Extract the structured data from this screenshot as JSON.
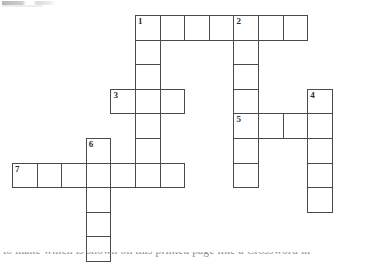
{
  "page": {
    "background_color": "#ffffff",
    "grid_line_color": "#4a4a4f",
    "number_color": "#2b2b2f",
    "width": 386,
    "height": 262
  },
  "grid": {
    "origin_x": 12,
    "origin_y": 15,
    "cell_size": 24.6,
    "columns": 13,
    "rows": 10
  },
  "entries": [
    {
      "number": "1",
      "direction": "across",
      "row": 0,
      "col": 5,
      "length": 7
    },
    {
      "number": "1",
      "direction": "down",
      "row": 0,
      "col": 5,
      "length": 7
    },
    {
      "number": "2",
      "direction": "down",
      "row": 0,
      "col": 9,
      "length": 7
    },
    {
      "number": "3",
      "direction": "across",
      "row": 3,
      "col": 4,
      "length": 3
    },
    {
      "number": "4",
      "direction": "down",
      "row": 3,
      "col": 12,
      "length": 5
    },
    {
      "number": "5",
      "direction": "across",
      "row": 4,
      "col": 9,
      "length": 4
    },
    {
      "number": "6",
      "direction": "down",
      "row": 5,
      "col": 3,
      "length": 5
    },
    {
      "number": "7",
      "direction": "across",
      "row": 6,
      "col": 0,
      "length": 7
    }
  ],
  "cells": [
    {
      "row": 0,
      "col": 5,
      "number": "1"
    },
    {
      "row": 0,
      "col": 6,
      "number": ""
    },
    {
      "row": 0,
      "col": 7,
      "number": ""
    },
    {
      "row": 0,
      "col": 8,
      "number": ""
    },
    {
      "row": 0,
      "col": 9,
      "number": "2"
    },
    {
      "row": 0,
      "col": 10,
      "number": ""
    },
    {
      "row": 0,
      "col": 11,
      "number": ""
    },
    {
      "row": 1,
      "col": 5,
      "number": ""
    },
    {
      "row": 1,
      "col": 9,
      "number": ""
    },
    {
      "row": 2,
      "col": 5,
      "number": ""
    },
    {
      "row": 2,
      "col": 9,
      "number": ""
    },
    {
      "row": 3,
      "col": 4,
      "number": "3"
    },
    {
      "row": 3,
      "col": 5,
      "number": ""
    },
    {
      "row": 3,
      "col": 6,
      "number": ""
    },
    {
      "row": 3,
      "col": 9,
      "number": ""
    },
    {
      "row": 3,
      "col": 12,
      "number": "4"
    },
    {
      "row": 4,
      "col": 5,
      "number": ""
    },
    {
      "row": 4,
      "col": 9,
      "number": "5"
    },
    {
      "row": 4,
      "col": 10,
      "number": ""
    },
    {
      "row": 4,
      "col": 11,
      "number": ""
    },
    {
      "row": 4,
      "col": 12,
      "number": ""
    },
    {
      "row": 5,
      "col": 3,
      "number": "6"
    },
    {
      "row": 5,
      "col": 5,
      "number": ""
    },
    {
      "row": 5,
      "col": 9,
      "number": ""
    },
    {
      "row": 5,
      "col": 12,
      "number": ""
    },
    {
      "row": 6,
      "col": 0,
      "number": "7"
    },
    {
      "row": 6,
      "col": 1,
      "number": ""
    },
    {
      "row": 6,
      "col": 2,
      "number": ""
    },
    {
      "row": 6,
      "col": 3,
      "number": ""
    },
    {
      "row": 6,
      "col": 4,
      "number": ""
    },
    {
      "row": 6,
      "col": 5,
      "number": ""
    },
    {
      "row": 6,
      "col": 6,
      "number": ""
    },
    {
      "row": 6,
      "col": 9,
      "number": ""
    },
    {
      "row": 6,
      "col": 12,
      "number": ""
    },
    {
      "row": 7,
      "col": 3,
      "number": ""
    },
    {
      "row": 7,
      "col": 12,
      "number": ""
    },
    {
      "row": 8,
      "col": 3,
      "number": ""
    },
    {
      "row": 9,
      "col": 3,
      "number": ""
    }
  ],
  "footer": {
    "clipped_text": "to make which is shown on this printed page like a Crossword in"
  }
}
